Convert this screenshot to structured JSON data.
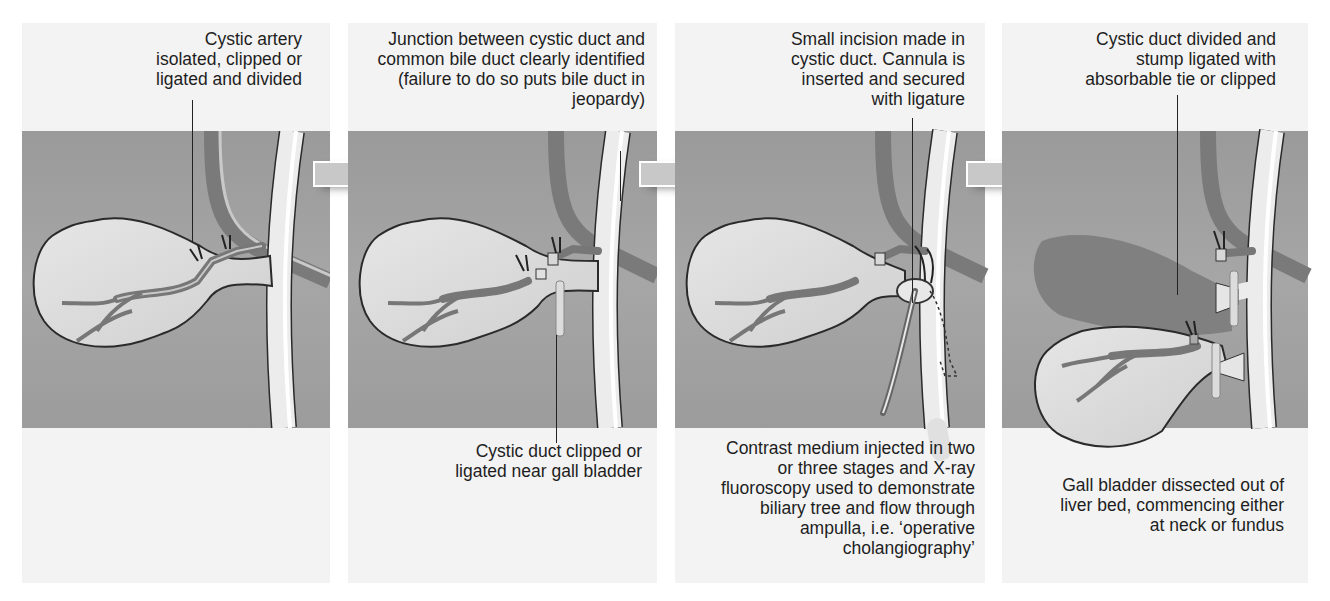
{
  "figure": {
    "colors": {
      "background": "#ffffff",
      "panel": "#f3f3f3",
      "tissue_band": "#a0a0a0",
      "gall_bladder": "#d8d8d8",
      "duct": "#ebebeb",
      "vessel": "#7d7d7d",
      "outline": "#2a2a2a",
      "arrow": "#c8c8c8"
    },
    "panels": [
      {
        "step": 1,
        "top_label": "Cystic artery\nisolated, clipped or\nligated and divided",
        "bottom_label": ""
      },
      {
        "step": 2,
        "top_label": "Junction between cystic duct and\ncommon bile duct clearly identified\n(failure to do so puts bile duct in\njeopardy)",
        "bottom_label": "Cystic duct clipped or\nligated near gall bladder"
      },
      {
        "step": 3,
        "top_label": "Small incision made in\ncystic duct. Cannula is\ninserted and secured\nwith ligature",
        "bottom_label": "Contrast medium injected in two\nor three stages and X-ray\nfluoroscopy used to demonstrate\nbiliary tree and flow through\nampulla, i.e. ‘operative\ncholangiography’"
      },
      {
        "step": 4,
        "top_label": "Cystic duct divided and\nstump ligated with\nabsorbable tie or clipped",
        "bottom_label": "Gall bladder dissected out of\nliver bed, commencing either\nat neck or fundus"
      }
    ],
    "arrows": [
      {
        "icon": "right-arrow-icon",
        "from_step": 1,
        "to_step": 2
      },
      {
        "icon": "right-arrow-icon",
        "from_step": 2,
        "to_step": 3
      },
      {
        "icon": "right-arrow-icon",
        "from_step": 3,
        "to_step": 4
      }
    ]
  }
}
